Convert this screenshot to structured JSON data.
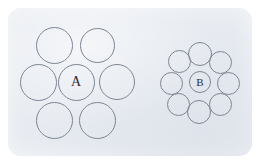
{
  "figure": {
    "type": "ebbinghaus-illusion",
    "background_color": "#ffffff",
    "card": {
      "fill_color": "#e7ebf1",
      "corner_radius_px": 13,
      "x": 8,
      "y": 8,
      "width": 244,
      "height": 148
    },
    "circle_stroke_color": "#7e8694",
    "circle_stroke_width_px": 1,
    "label_color": "#2b2b30"
  },
  "groups": [
    {
      "id": "group-a",
      "center_label": "A",
      "center_circle": {
        "cx": 76,
        "cy": 82,
        "d": 37
      },
      "surround_count": 6,
      "surround_size_relation": "large",
      "surrounding_circles": [
        {
          "cx": 54,
          "cy": 45,
          "d": 37
        },
        {
          "cx": 97,
          "cy": 45,
          "d": 35
        },
        {
          "cx": 38,
          "cy": 82,
          "d": 37
        },
        {
          "cx": 117,
          "cy": 82,
          "d": 36
        },
        {
          "cx": 54,
          "cy": 120,
          "d": 37
        },
        {
          "cx": 97,
          "cy": 120,
          "d": 37
        }
      ]
    },
    {
      "id": "group-b",
      "center_label": "B",
      "center_circle": {
        "cx": 200,
        "cy": 82,
        "d": 22
      },
      "surround_count": 8,
      "surround_size_relation": "small",
      "surrounding_circles": [
        {
          "cx": 200,
          "cy": 54,
          "d": 24
        },
        {
          "cx": 220,
          "cy": 62,
          "d": 23
        },
        {
          "cx": 228,
          "cy": 83,
          "d": 23
        },
        {
          "cx": 220,
          "cy": 104,
          "d": 23
        },
        {
          "cx": 199,
          "cy": 112,
          "d": 24
        },
        {
          "cx": 178,
          "cy": 104,
          "d": 23
        },
        {
          "cx": 171,
          "cy": 83,
          "d": 23
        },
        {
          "cx": 179,
          "cy": 61,
          "d": 23
        }
      ]
    }
  ]
}
